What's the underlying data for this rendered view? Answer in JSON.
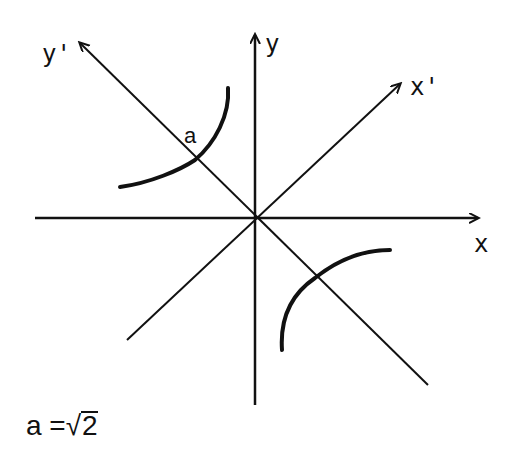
{
  "diagram": {
    "axes": {
      "x": {
        "label": "x"
      },
      "y": {
        "label": "y"
      },
      "x_prime": {
        "label": "x'"
      },
      "y_prime": {
        "label": "y'"
      }
    },
    "vertex_label": "a",
    "equation": {
      "lhs": "a",
      "op": "=",
      "radical": "√",
      "radicand": "2"
    },
    "colors": {
      "ink": "#111111",
      "background": "#ffffff"
    }
  }
}
